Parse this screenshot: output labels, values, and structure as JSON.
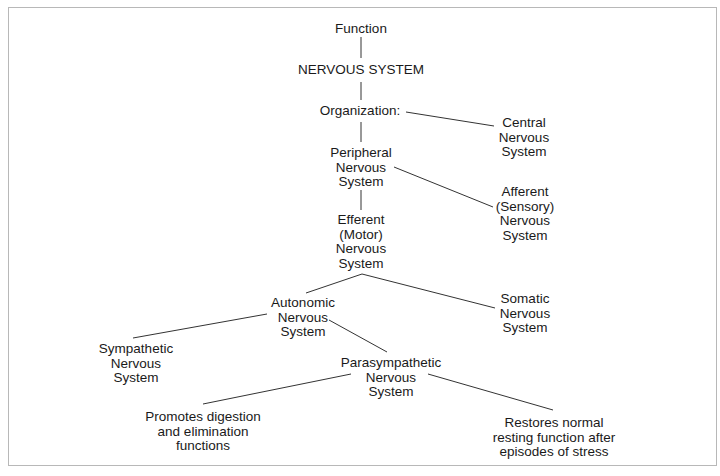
{
  "diagram": {
    "title": "Function",
    "root": "NERVOUS SYSTEM",
    "nodes": {
      "function": "Function",
      "nervous_system": "NERVOUS SYSTEM",
      "organization": "Organization:",
      "central": "Central\nNervous\nSystem",
      "peripheral": "Peripheral\nNervous\nSystem",
      "afferent": "Afferent\n(Sensory)\nNervous\nSystem",
      "efferent": "Efferent\n(Motor)\nNervous\nSystem",
      "autonomic": "Autonomic\nNervous\nSystem",
      "somatic": "Somatic\nNervous\nSystem",
      "sympathetic": "Sympathetic\nNervous\nSystem",
      "parasympathetic": "Parasympathetic\nNervous\nSystem",
      "promotes": "Promotes digestion\nand elimination\nfunctions",
      "restores": "Restores normal\nresting function after\nepisodes of stress"
    },
    "edges": [
      [
        "function",
        "nervous_system"
      ],
      [
        "nervous_system",
        "organization"
      ],
      [
        "organization",
        "central"
      ],
      [
        "organization",
        "peripheral"
      ],
      [
        "peripheral",
        "afferent"
      ],
      [
        "peripheral",
        "efferent"
      ],
      [
        "efferent",
        "autonomic"
      ],
      [
        "efferent",
        "somatic"
      ],
      [
        "autonomic",
        "sympathetic"
      ],
      [
        "autonomic",
        "parasympathetic"
      ],
      [
        "parasympathetic",
        "promotes"
      ],
      [
        "parasympathetic",
        "restores"
      ]
    ],
    "colors": {
      "line": "#333333",
      "text": "#1a1a1a",
      "border": "#b8b8b8"
    }
  }
}
